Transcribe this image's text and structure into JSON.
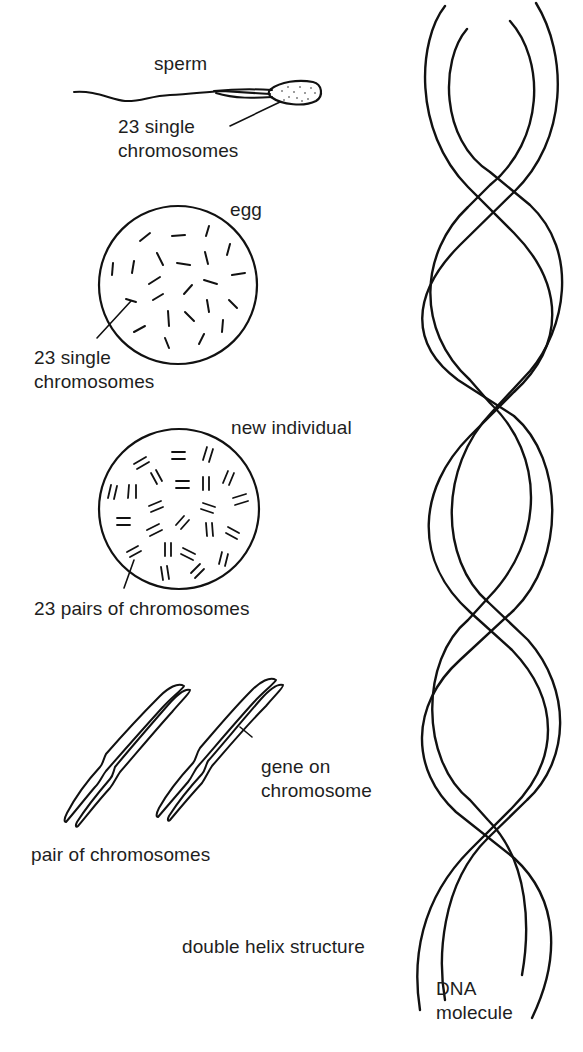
{
  "diagram": {
    "type": "illustration",
    "colors": {
      "line": "#111111",
      "text": "#1e1e1e",
      "background": "#ffffff"
    },
    "sections": [
      {
        "id": "sperm",
        "title": "sperm",
        "annotation_line1": "23 single",
        "annotation_line2": "chromosomes"
      },
      {
        "id": "egg",
        "title": "egg",
        "annotation_line1": "23 single",
        "annotation_line2": "chromosomes",
        "chromosome_count": 23
      },
      {
        "id": "new-individual",
        "title": "new individual",
        "annotation": "23 pairs of chromosomes",
        "chromosome_pairs": 23
      },
      {
        "id": "chromosome-pair",
        "caption": "pair of chromosomes",
        "gene_label_line1": "gene on",
        "gene_label_line2": "chromosome"
      },
      {
        "id": "dna",
        "structure_label": "double helix structure",
        "title_line1": "DNA",
        "title_line2": "molecule"
      }
    ]
  }
}
